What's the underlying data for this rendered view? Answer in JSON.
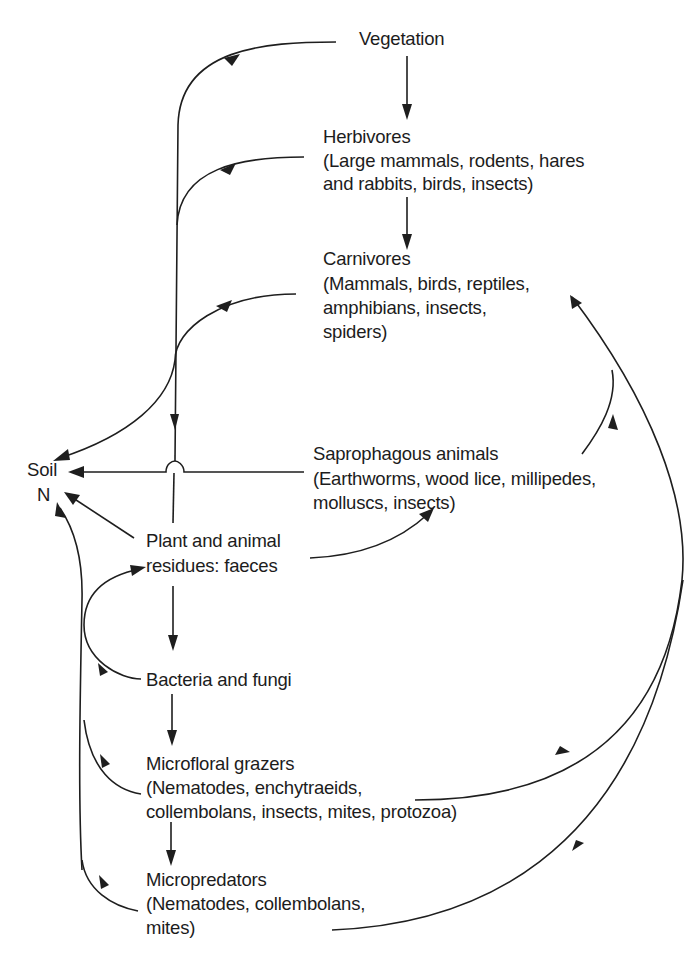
{
  "diagram": {
    "type": "flow-diagram",
    "colors": {
      "ink": "#1e1e1e",
      "background": "#ffffff"
    },
    "nodes": {
      "vegetation": {
        "lines": [
          "Vegetation"
        ]
      },
      "herbivores": {
        "lines": [
          "Herbivores",
          "(Large mammals, rodents, hares",
          "and rabbits, birds, insects)"
        ]
      },
      "carnivores": {
        "lines": [
          "Carnivores",
          "(Mammals, birds, reptiles,",
          "amphibians, insects,",
          "spiders)"
        ]
      },
      "soil": {
        "lines": [
          "Soil",
          "N"
        ]
      },
      "saprophagous": {
        "lines": [
          "Saprophagous animals",
          "(Earthworms, wood lice, millipedes,",
          "molluscs, insects)"
        ]
      },
      "residues": {
        "lines": [
          "Plant and animal",
          "residues: faeces"
        ]
      },
      "bacteria": {
        "lines": [
          "Bacteria and fungi"
        ]
      },
      "grazers": {
        "lines": [
          "Microfloral grazers",
          "(Nematodes, enchytraeids,",
          "collembolans, insects, mites, protozoa)"
        ]
      },
      "micropredators": {
        "lines": [
          "Micropredators",
          "(Nematodes, collembolans,",
          "mites)"
        ]
      }
    },
    "edges": [
      {
        "from": "vegetation",
        "to": "herbivores"
      },
      {
        "from": "herbivores",
        "to": "carnivores"
      },
      {
        "from": "vegetation",
        "to": "residues"
      },
      {
        "from": "herbivores",
        "to": "residues"
      },
      {
        "from": "carnivores",
        "to": "soil"
      },
      {
        "from": "saprophagous",
        "to": "soil"
      },
      {
        "from": "residues",
        "to": "soil"
      },
      {
        "from": "residues",
        "to": "saprophagous"
      },
      {
        "from": "residues",
        "to": "bacteria"
      },
      {
        "from": "bacteria",
        "to": "residues"
      },
      {
        "from": "bacteria",
        "to": "grazers"
      },
      {
        "from": "grazers",
        "to": "micropredators"
      },
      {
        "from": "grazers",
        "to": "soil"
      },
      {
        "from": "micropredators",
        "to": "soil"
      },
      {
        "from": "saprophagous",
        "to": "carnivores"
      },
      {
        "from": "grazers",
        "to": "carnivores"
      },
      {
        "from": "micropredators",
        "to": "carnivores"
      }
    ]
  }
}
